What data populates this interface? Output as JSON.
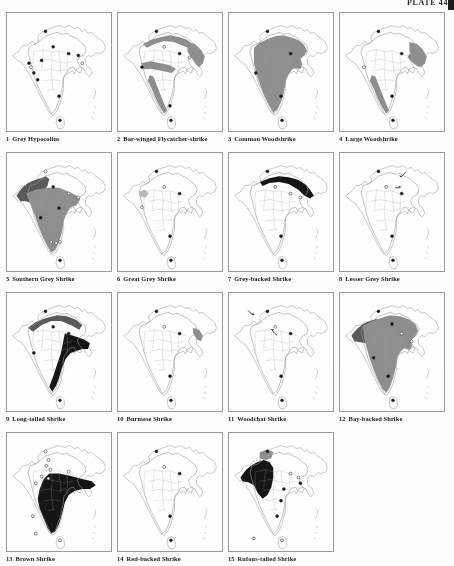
{
  "plate": {
    "label": "PLATE 44",
    "page_kind": "distribution-map-plate"
  },
  "style": {
    "outline_color": "#9a9a9a",
    "border_color": "#9a9a9a",
    "shade_light": "#bcbcbc",
    "shade_mid": "#8f8f8f",
    "shade_dark": "#5a5a5a",
    "shade_black": "#151515",
    "marker_fill": "#1a1a1a",
    "marker_open": "#ffffff",
    "caption_color": "#1a1a1a"
  },
  "maps": [
    {
      "number": "1",
      "name": "Grey Hypocolius",
      "shading": [],
      "markers": [
        {
          "x": 34,
          "y": 49,
          "filled": true
        },
        {
          "x": 23,
          "y": 56,
          "filled": false
        },
        {
          "x": 21,
          "y": 52,
          "filled": true
        },
        {
          "x": 26,
          "y": 62,
          "filled": true
        },
        {
          "x": 30,
          "y": 69,
          "filled": true
        },
        {
          "x": 38,
          "y": 19,
          "filled": true
        },
        {
          "x": 46,
          "y": 35,
          "filled": true
        },
        {
          "x": 62,
          "y": 42,
          "filled": true
        },
        {
          "x": 72,
          "y": 44,
          "filled": true
        },
        {
          "x": 76,
          "y": 52,
          "filled": false
        },
        {
          "x": 52,
          "y": 86,
          "filled": true
        },
        {
          "x": 53,
          "y": 111,
          "filled": true
        }
      ]
    },
    {
      "number": "2",
      "name": "Bar-winged Flycatcher-shrike",
      "shading": [
        {
          "tone": "mid",
          "region": "himalaya-foothill-band"
        },
        {
          "tone": "mid",
          "region": "northeast"
        },
        {
          "tone": "mid",
          "region": "western-ghats"
        },
        {
          "tone": "mid",
          "region": "central-belt"
        }
      ],
      "markers": [
        {
          "x": 38,
          "y": 19,
          "filled": true
        },
        {
          "x": 46,
          "y": 35,
          "filled": false
        },
        {
          "x": 62,
          "y": 42,
          "filled": true
        },
        {
          "x": 72,
          "y": 46,
          "filled": false
        },
        {
          "x": 23,
          "y": 56,
          "filled": true
        },
        {
          "x": 53,
          "y": 111,
          "filled": true
        },
        {
          "x": 52,
          "y": 96,
          "filled": true
        }
      ]
    },
    {
      "number": "3",
      "name": "Common Woodshrike",
      "shading": [
        {
          "tone": "mid",
          "region": "peninsular-india-wide"
        }
      ],
      "markers": [
        {
          "x": 38,
          "y": 19,
          "filled": true
        },
        {
          "x": 62,
          "y": 42,
          "filled": true
        },
        {
          "x": 26,
          "y": 62,
          "filled": true
        },
        {
          "x": 52,
          "y": 86,
          "filled": true
        },
        {
          "x": 53,
          "y": 111,
          "filled": true
        }
      ]
    },
    {
      "number": "4",
      "name": "Large Woodshrike",
      "shading": [
        {
          "tone": "mid",
          "region": "northeast"
        },
        {
          "tone": "mid",
          "region": "western-ghats"
        },
        {
          "tone": "mid",
          "region": "east-coast-strip"
        }
      ],
      "markers": [
        {
          "x": 38,
          "y": 19,
          "filled": true
        },
        {
          "x": 62,
          "y": 42,
          "filled": true
        },
        {
          "x": 23,
          "y": 56,
          "filled": false
        },
        {
          "x": 52,
          "y": 86,
          "filled": true
        },
        {
          "x": 53,
          "y": 111,
          "filled": true
        }
      ]
    },
    {
      "number": "5",
      "name": "Southern Grey Shrike",
      "shading": [
        {
          "tone": "dark",
          "region": "northwest-pakistan-punjab"
        },
        {
          "tone": "mid",
          "region": "central-and-peninsular-india"
        }
      ],
      "markers": [
        {
          "x": 38,
          "y": 19,
          "filled": false
        },
        {
          "x": 46,
          "y": 35,
          "filled": true
        },
        {
          "x": 62,
          "y": 42,
          "filled": false
        },
        {
          "x": 72,
          "y": 46,
          "filled": false
        },
        {
          "x": 52,
          "y": 57,
          "filled": true
        },
        {
          "x": 33,
          "y": 67,
          "filled": true
        },
        {
          "x": 44,
          "y": 92,
          "filled": false
        },
        {
          "x": 49,
          "y": 93,
          "filled": false
        },
        {
          "x": 53,
          "y": 92,
          "filled": false
        },
        {
          "x": 53,
          "y": 111,
          "filled": true
        }
      ]
    },
    {
      "number": "6",
      "name": "Great Grey Shrike",
      "shading": [
        {
          "tone": "light",
          "region": "small-northwest-patch"
        }
      ],
      "markers": [
        {
          "x": 38,
          "y": 19,
          "filled": true
        },
        {
          "x": 46,
          "y": 35,
          "filled": false
        },
        {
          "x": 62,
          "y": 42,
          "filled": true
        },
        {
          "x": 23,
          "y": 56,
          "filled": false
        },
        {
          "x": 52,
          "y": 86,
          "filled": true
        },
        {
          "x": 53,
          "y": 111,
          "filled": true
        }
      ]
    },
    {
      "number": "7",
      "name": "Grey-backed Shrike",
      "shading": [
        {
          "tone": "black",
          "region": "himalaya-northeast-band"
        }
      ],
      "markers": [
        {
          "x": 38,
          "y": 19,
          "filled": true
        },
        {
          "x": 46,
          "y": 35,
          "filled": false
        },
        {
          "x": 62,
          "y": 42,
          "filled": false
        },
        {
          "x": 72,
          "y": 46,
          "filled": false
        },
        {
          "x": 52,
          "y": 86,
          "filled": true
        },
        {
          "x": 53,
          "y": 111,
          "filled": true
        }
      ]
    },
    {
      "number": "8",
      "name": "Lesser Grey Shrike",
      "shading": [],
      "markers": [
        {
          "x": 38,
          "y": 19,
          "filled": true
        },
        {
          "x": 46,
          "y": 35,
          "filled": false
        },
        {
          "x": 62,
          "y": 42,
          "filled": true
        },
        {
          "x": 52,
          "y": 86,
          "filled": true
        },
        {
          "x": 53,
          "y": 111,
          "filled": true
        }
      ],
      "arrows": [
        {
          "x": 66,
          "y": 20,
          "dir": "down-left"
        },
        {
          "x": 55,
          "y": 36,
          "dir": "right"
        }
      ]
    },
    {
      "number": "9",
      "name": "Long-tailed Shrike",
      "shading": [
        {
          "tone": "dark",
          "region": "himalaya-north-band"
        },
        {
          "tone": "mid",
          "region": "most-of-india"
        },
        {
          "tone": "black",
          "region": "east-india-and-northeast"
        }
      ],
      "markers": [
        {
          "x": 38,
          "y": 19,
          "filled": true
        },
        {
          "x": 46,
          "y": 35,
          "filled": true
        },
        {
          "x": 62,
          "y": 42,
          "filled": true
        },
        {
          "x": 26,
          "y": 62,
          "filled": true
        },
        {
          "x": 53,
          "y": 111,
          "filled": true
        }
      ]
    },
    {
      "number": "10",
      "name": "Burmese Shrike",
      "shading": [
        {
          "tone": "mid",
          "region": "far-northeast-small"
        }
      ],
      "markers": [
        {
          "x": 38,
          "y": 19,
          "filled": true
        },
        {
          "x": 46,
          "y": 35,
          "filled": false
        },
        {
          "x": 62,
          "y": 42,
          "filled": true
        },
        {
          "x": 52,
          "y": 86,
          "filled": true
        },
        {
          "x": 53,
          "y": 111,
          "filled": true
        }
      ]
    },
    {
      "number": "11",
      "name": "Woodchat Shrike",
      "shading": [],
      "markers": [
        {
          "x": 38,
          "y": 19,
          "filled": true
        },
        {
          "x": 46,
          "y": 35,
          "filled": false
        },
        {
          "x": 62,
          "y": 42,
          "filled": true
        },
        {
          "x": 52,
          "y": 86,
          "filled": true
        },
        {
          "x": 53,
          "y": 111,
          "filled": true
        }
      ],
      "arrows": [
        {
          "x": 18,
          "y": 18,
          "dir": "down-right"
        },
        {
          "x": 48,
          "y": 44,
          "dir": "up-left"
        }
      ]
    },
    {
      "number": "12",
      "name": "Bay-backed Shrike",
      "shading": [
        {
          "tone": "dark",
          "region": "northwest-band"
        },
        {
          "tone": "mid",
          "region": "india-wide"
        }
      ],
      "markers": [
        {
          "x": 38,
          "y": 19,
          "filled": true
        },
        {
          "x": 52,
          "y": 32,
          "filled": true
        },
        {
          "x": 62,
          "y": 42,
          "filled": false
        },
        {
          "x": 72,
          "y": 50,
          "filled": false
        },
        {
          "x": 33,
          "y": 67,
          "filled": true
        },
        {
          "x": 48,
          "y": 86,
          "filled": true
        },
        {
          "x": 53,
          "y": 111,
          "filled": true
        }
      ]
    },
    {
      "number": "13",
      "name": "Brown Shrike",
      "shading": [
        {
          "tone": "black",
          "region": "east-and-south-india"
        }
      ],
      "markers": [
        {
          "x": 38,
          "y": 19,
          "filled": false
        },
        {
          "x": 41,
          "y": 28,
          "filled": false
        },
        {
          "x": 39,
          "y": 34,
          "filled": false
        },
        {
          "x": 43,
          "y": 38,
          "filled": false
        },
        {
          "x": 34,
          "y": 45,
          "filled": false
        },
        {
          "x": 41,
          "y": 47,
          "filled": false
        },
        {
          "x": 62,
          "y": 40,
          "filled": false
        },
        {
          "x": 28,
          "y": 52,
          "filled": false
        },
        {
          "x": 25,
          "y": 86,
          "filled": false
        },
        {
          "x": 28,
          "y": 104,
          "filled": false
        },
        {
          "x": 53,
          "y": 111,
          "filled": false
        }
      ]
    },
    {
      "number": "14",
      "name": "Red-backed Shrike",
      "shading": [],
      "markers": [
        {
          "x": 38,
          "y": 19,
          "filled": true
        },
        {
          "x": 46,
          "y": 35,
          "filled": false
        },
        {
          "x": 62,
          "y": 42,
          "filled": true
        },
        {
          "x": 52,
          "y": 86,
          "filled": true
        },
        {
          "x": 53,
          "y": 111,
          "filled": true
        }
      ]
    },
    {
      "number": "15",
      "name": "Rufous-tailed Shrike",
      "shading": [
        {
          "tone": "black",
          "region": "northwest-india-pakistan"
        },
        {
          "tone": "mid",
          "region": "north-small-patch"
        }
      ],
      "markers": [
        {
          "x": 38,
          "y": 19,
          "filled": true
        },
        {
          "x": 62,
          "y": 42,
          "filled": false
        },
        {
          "x": 70,
          "y": 46,
          "filled": false
        },
        {
          "x": 72,
          "y": 52,
          "filled": true
        },
        {
          "x": 55,
          "y": 58,
          "filled": true
        },
        {
          "x": 52,
          "y": 70,
          "filled": true
        },
        {
          "x": 48,
          "y": 86,
          "filled": true
        },
        {
          "x": 24,
          "y": 109,
          "filled": false
        },
        {
          "x": 53,
          "y": 111,
          "filled": false
        }
      ]
    }
  ]
}
